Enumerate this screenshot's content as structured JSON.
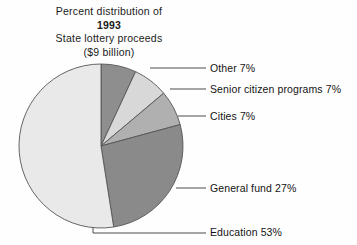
{
  "title": {
    "line1": "Percent distribution of",
    "year": "1993",
    "line3": "State lottery proceeds",
    "line4": "($9 billion)"
  },
  "chart_data": {
    "type": "pie",
    "title": "Percent distribution of 1993 State lottery proceeds ($9 billion)",
    "total_label": "$9 billion",
    "year": "1993",
    "units": "percent",
    "legend_position": "callout-right",
    "grid": false,
    "start_angle_deg": 0,
    "direction": "clockwise",
    "categories": [
      "Other",
      "Senior citizen programs",
      "Cities",
      "General fund",
      "Education"
    ],
    "values": [
      7,
      7,
      7,
      27,
      53
    ],
    "labels": [
      "Other 7%",
      "Senior citizen programs 7%",
      "Cities 7%",
      "General fund 27%",
      "Education 53%"
    ],
    "colors": [
      "#8e8e8e",
      "#d8d8d8",
      "#b0b0b0",
      "#8a8a8a",
      "#e9e9e9"
    ],
    "slices": [
      {
        "name": "Other",
        "value": 7,
        "label": "Other 7%",
        "color": "#8e8e8e"
      },
      {
        "name": "Senior citizen programs",
        "value": 7,
        "label": "Senior citizen programs 7%",
        "color": "#d8d8d8"
      },
      {
        "name": "Cities",
        "value": 7,
        "label": "Cities 7%",
        "color": "#b0b0b0"
      },
      {
        "name": "General fund",
        "value": 27,
        "label": "General fund 27%",
        "color": "#8a8a8a"
      },
      {
        "name": "Education",
        "value": 53,
        "label": "Education 53%",
        "color": "#e9e9e9"
      }
    ],
    "outline_color": "#555555"
  }
}
